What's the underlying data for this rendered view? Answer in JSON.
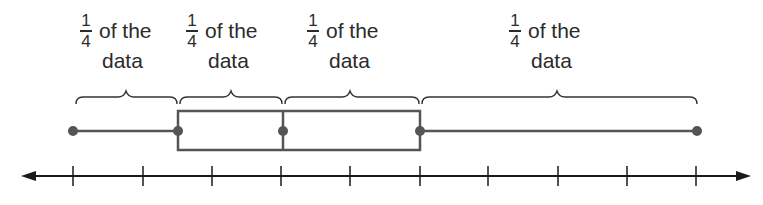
{
  "diagram": {
    "type": "box-and-whisker plot",
    "labels": [
      {
        "numerator": "1",
        "denominator": "4",
        "line1": "of the",
        "line2": "data",
        "left": 80
      },
      {
        "numerator": "1",
        "denominator": "4",
        "line1": "of the",
        "line2": "data",
        "left": 186
      },
      {
        "numerator": "1",
        "denominator": "4",
        "line1": "of the",
        "line2": "data",
        "left": 307
      },
      {
        "numerator": "1",
        "denominator": "4",
        "line1": "of the",
        "line2": "data",
        "left": 509
      }
    ],
    "five_number_summary_px": {
      "min": 73,
      "q1": 178,
      "median": 283,
      "q3": 420,
      "max": 697
    },
    "axis": {
      "tick_count": 10,
      "tick_positions_px": [
        73,
        143,
        212,
        281,
        350,
        420,
        488,
        558,
        627,
        696
      ],
      "arrows": "both ends"
    },
    "colors": {
      "plot": "#555555",
      "axis": "#1a1a1a",
      "text": "#2b2b2b"
    }
  }
}
